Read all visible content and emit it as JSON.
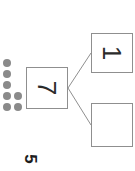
{
  "worksheet": {
    "problem_number": "5",
    "rotation_degrees": 90,
    "background_color": "#ffffff",
    "line_color": "#8f8f8f",
    "dot_color": "#8a8a8a",
    "text_color": "#2b2b2b"
  },
  "dot_tally": {
    "label": "dot-tally",
    "total_count": 7,
    "columns": [
      {
        "count": 5,
        "rows": [
          0,
          1,
          2,
          3,
          4
        ]
      },
      {
        "count": 2,
        "rows": [
          3,
          4
        ]
      }
    ]
  },
  "number_bond": {
    "whole": {
      "name": "whole-box",
      "value": "7",
      "filled": true
    },
    "parts": [
      {
        "name": "part-box-top",
        "value": "1",
        "filled": true
      },
      {
        "name": "part-box-bottom",
        "value": "",
        "filled": false
      }
    ],
    "connector_vertex": {
      "x": 68,
      "y": 88
    },
    "connector_endpoints": [
      {
        "x": 91,
        "y": 53
      },
      {
        "x": 91,
        "y": 125
      }
    ]
  }
}
